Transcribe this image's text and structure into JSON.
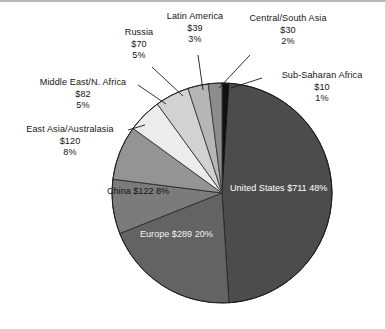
{
  "figure": {
    "title": "",
    "background": "#ffffff",
    "frame_color": "#b9b9b9"
  },
  "chart_data": {
    "type": "pie",
    "title": "",
    "xlabel": "",
    "ylabel": "",
    "value_prefix": "$",
    "total_value": 1473,
    "legend": "none (direct labels)",
    "start_angle_deg": 0,
    "direction": "clockwise",
    "categories": [
      "Sub-Saharan Africa",
      "United States",
      "Europe",
      "China",
      "East Asia/Australasia",
      "Middle East/N. Africa",
      "Russia",
      "Latin America",
      "Central/South Asia"
    ],
    "values": [
      10,
      711,
      289,
      122,
      120,
      82,
      70,
      39,
      30
    ],
    "percents": [
      1,
      48,
      20,
      8,
      8,
      5,
      5,
      3,
      2
    ],
    "colors": [
      "#111111",
      "#4c4c4c",
      "#636363",
      "#7b7b7b",
      "#949494",
      "#ececec",
      "#d2d2d2",
      "#b6b6b6",
      "#8d8d8d"
    ],
    "slices": [
      {
        "name": "Sub-Saharan Africa",
        "value_label": "$10",
        "percent_label": "1%",
        "value": 10,
        "percent": 1,
        "color": "#111111",
        "label_position": "outside"
      },
      {
        "name": "United States",
        "value_label": "$711",
        "percent_label": "48%",
        "value": 711,
        "percent": 48,
        "color": "#4c4c4c",
        "label_position": "inside"
      },
      {
        "name": "Europe",
        "value_label": "$289",
        "percent_label": "20%",
        "value": 289,
        "percent": 20,
        "color": "#636363",
        "label_position": "inside"
      },
      {
        "name": "China",
        "value_label": "$122",
        "percent_label": "8%",
        "value": 122,
        "percent": 8,
        "color": "#7b7b7b",
        "label_position": "inside"
      },
      {
        "name": "East Asia/Australasia",
        "value_label": "$120",
        "percent_label": "8%",
        "value": 120,
        "percent": 8,
        "color": "#949494",
        "label_position": "outside"
      },
      {
        "name": "Middle East/N. Africa",
        "value_label": "$82",
        "percent_label": "5%",
        "value": 82,
        "percent": 5,
        "color": "#ececec",
        "label_position": "outside"
      },
      {
        "name": "Russia",
        "value_label": "$70",
        "percent_label": "5%",
        "value": 70,
        "percent": 5,
        "color": "#d2d2d2",
        "label_position": "outside"
      },
      {
        "name": "Latin America",
        "value_label": "$39",
        "percent_label": "3%",
        "value": 39,
        "percent": 3,
        "color": "#b6b6b6",
        "label_position": "outside"
      },
      {
        "name": "Central/South Asia",
        "value_label": "$30",
        "percent_label": "2%",
        "value": 30,
        "percent": 2,
        "color": "#8d8d8d",
        "label_position": "outside"
      }
    ]
  },
  "labels": {
    "united_states": {
      "name": "United States",
      "value": "$711",
      "percent": "48%"
    },
    "europe": {
      "name": "Europe",
      "value": "$289",
      "percent": "20%"
    },
    "china": {
      "name": "China",
      "value": "$122",
      "percent": "8%"
    },
    "east_asia": {
      "name": "East Asia/Australasia",
      "value": "$120",
      "percent": "8%"
    },
    "middle_east": {
      "name": "Middle East/N. Africa",
      "value": "$82",
      "percent": "5%"
    },
    "russia": {
      "name": "Russia",
      "value": "$70",
      "percent": "5%"
    },
    "latin_america": {
      "name": "Latin America",
      "value": "$39",
      "percent": "3%"
    },
    "central_s_asia": {
      "name": "Central/South Asia",
      "value": "$30",
      "percent": "2%"
    },
    "sub_saharan": {
      "name": "Sub-Saharan Africa",
      "value": "$10",
      "percent": "1%"
    }
  }
}
